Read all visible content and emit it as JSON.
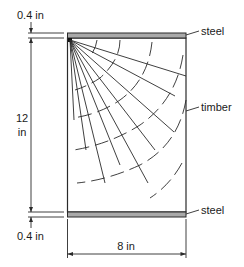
{
  "figure": {
    "type": "composite beam cross-section",
    "colors": {
      "line": "#2a2a2a",
      "steel_fill": "#a9a9a9",
      "background": "#ffffff"
    }
  },
  "labels": {
    "steel_top": "steel",
    "timber": "timber",
    "steel_bottom": "steel",
    "top_thickness": "0.4 in",
    "bottom_thickness": "0.4 in",
    "height_value": "12",
    "height_unit": "in",
    "width": "8 in"
  },
  "dimensions": {
    "steel_plate_thickness_in": 0.4,
    "timber_height_in": 12,
    "width_in": 8
  },
  "components": [
    {
      "name": "top steel plate",
      "material": "steel"
    },
    {
      "name": "timber core",
      "material": "timber"
    },
    {
      "name": "bottom steel plate",
      "material": "steel"
    }
  ]
}
